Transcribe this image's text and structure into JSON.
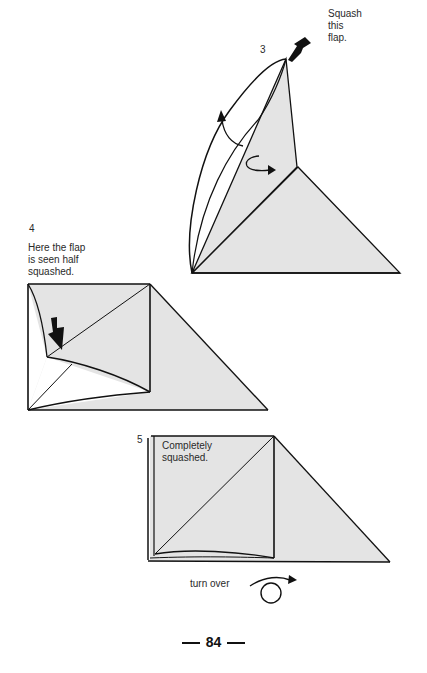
{
  "steps": [
    {
      "number": "3",
      "caption_lines": [
        "Squash",
        "this",
        "flap."
      ]
    },
    {
      "number": "4",
      "caption_lines": [
        "Here the flap",
        "is seen half",
        "squashed."
      ]
    },
    {
      "number": "5",
      "caption_lines": [
        "Completely",
        "squashed."
      ]
    }
  ],
  "turn_over_label": "turn over",
  "page_number": "84",
  "colors": {
    "paper_fill": "#e4e4e4",
    "line": "#111111",
    "background": "#ffffff"
  }
}
